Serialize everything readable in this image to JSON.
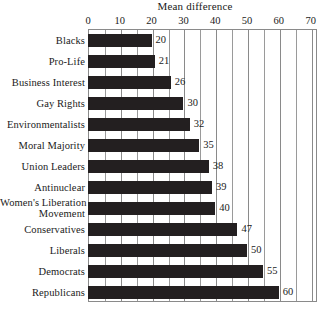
{
  "chart_data": {
    "type": "bar",
    "orientation": "horizontal",
    "title": "Mean difference",
    "xlabel": "",
    "ylabel": "",
    "xlim": [
      0,
      72
    ],
    "xticks": [
      0,
      10,
      20,
      30,
      40,
      50,
      60,
      70
    ],
    "xtick_labels": [
      "0",
      "10",
      "20",
      "30",
      "40",
      "50",
      "60",
      "70"
    ],
    "minor_tick_step": 5,
    "grid": true,
    "legend": null,
    "bar_color": "#231f20",
    "categories": [
      "Blacks",
      "Pro-Life",
      "Business Interest",
      "Gay Rights",
      "Environmentalists",
      "Moral Majority",
      "Union Leaders",
      "Antinuclear",
      "Women's Liberation Movement",
      "Conservatives",
      "Liberals",
      "Democrats",
      "Republicans"
    ],
    "category_lines": [
      [
        "Blacks"
      ],
      [
        "Pro-Life"
      ],
      [
        "Business Interest"
      ],
      [
        "Gay Rights"
      ],
      [
        "Environmentalists"
      ],
      [
        "Moral Majority"
      ],
      [
        "Union Leaders"
      ],
      [
        "Antinuclear"
      ],
      [
        "Women's Liberation",
        "Movement"
      ],
      [
        "Conservatives"
      ],
      [
        "Liberals"
      ],
      [
        "Democrats"
      ],
      [
        "Republicans"
      ]
    ],
    "values": [
      20,
      21,
      26,
      30,
      32,
      35,
      38,
      39,
      40,
      47,
      50,
      55,
      60
    ],
    "value_labels": [
      "20",
      "21",
      "26",
      "30",
      "32",
      "35",
      "38",
      "39",
      "40",
      "47",
      "50",
      "55",
      "60"
    ]
  }
}
